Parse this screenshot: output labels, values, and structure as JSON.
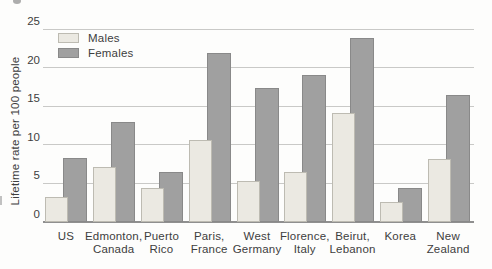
{
  "chart_data": {
    "type": "bar",
    "title": "",
    "xlabel": "",
    "ylabel": "Lifetime rate per 100 people",
    "ylim": [
      0,
      25
    ],
    "yticks": [
      0,
      5,
      10,
      15,
      20,
      25
    ],
    "grid": true,
    "legend_position": "top-left-inside",
    "categories": [
      "US",
      "Edmonton, Canada",
      "Puerto Rico",
      "Paris, France",
      "West Germany",
      "Florence, Italy",
      "Beirut, Lebanon",
      "Korea",
      "New Zealand"
    ],
    "category_label_lines": [
      [
        "US"
      ],
      [
        "Edmonton,",
        "Canada"
      ],
      [
        "Puerto",
        "Rico"
      ],
      [
        "Paris,",
        "France"
      ],
      [
        "West",
        "Germany"
      ],
      [
        "Florence,",
        "Italy"
      ],
      [
        "Beirut,",
        "Lebanon"
      ],
      [
        "Korea"
      ],
      [
        "New",
        "Zealand"
      ]
    ],
    "series": [
      {
        "name": "Males",
        "color": "#ebe9e2",
        "border_color": "#bdbbb2",
        "values": [
          3.2,
          7.1,
          4.4,
          10.6,
          5.3,
          6.5,
          14.1,
          2.6,
          8.2
        ]
      },
      {
        "name": "Females",
        "color": "#a0a0a0",
        "border_color": "#898989",
        "values": [
          8.3,
          12.9,
          6.5,
          21.9,
          17.4,
          19.1,
          23.8,
          4.4,
          16.4
        ]
      }
    ],
    "colors": {
      "gridline": "#c9c9c7",
      "axis_line": "#8f8f8f",
      "text": "#3e3e3e",
      "background": "#fdfdfc"
    }
  }
}
